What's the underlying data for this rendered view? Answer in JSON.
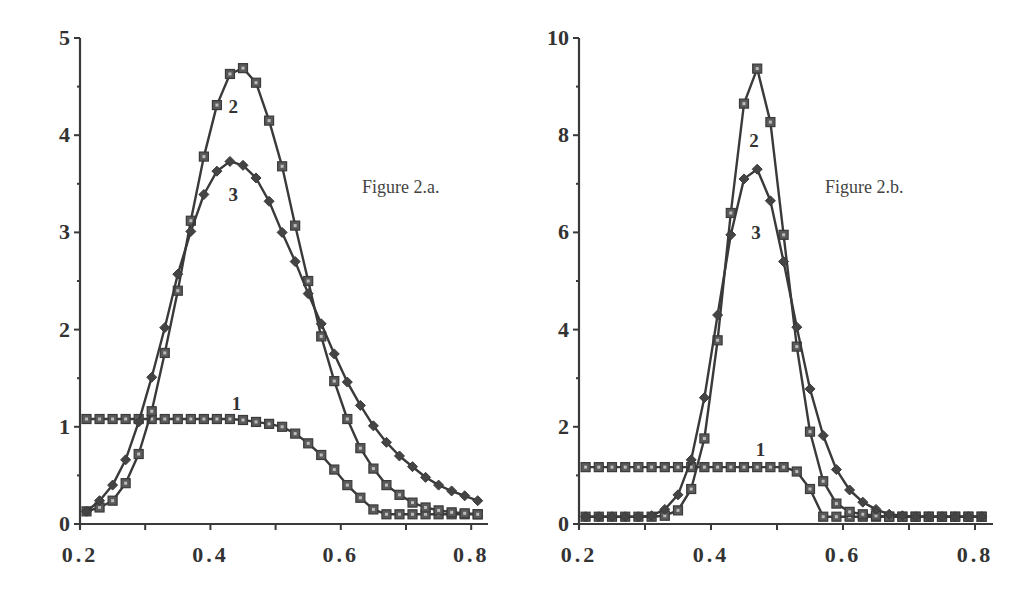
{
  "chart_data": [
    {
      "type": "line",
      "title": "Figure 2.a.",
      "xlabel": "",
      "ylabel": "",
      "xlim": [
        0.2,
        0.82
      ],
      "ylim": [
        0,
        5
      ],
      "xticks": [
        "0.2",
        "0.4",
        "0.6",
        "0.8"
      ],
      "yticks": [
        "0",
        "1",
        "2",
        "3",
        "4",
        "5"
      ],
      "grid": false,
      "legend": "inline curve labels 1, 2, 3",
      "series": [
        {
          "name": "1",
          "marker": "square",
          "label_pos": [
            0.44,
            1.25
          ],
          "x": [
            0.21,
            0.23,
            0.25,
            0.27,
            0.29,
            0.31,
            0.33,
            0.35,
            0.37,
            0.39,
            0.41,
            0.43,
            0.45,
            0.47,
            0.49,
            0.51,
            0.53,
            0.55,
            0.57,
            0.59,
            0.61,
            0.63,
            0.65,
            0.67,
            0.69,
            0.71,
            0.73,
            0.75,
            0.77,
            0.79,
            0.81
          ],
          "y": [
            1.08,
            1.08,
            1.08,
            1.08,
            1.08,
            1.08,
            1.08,
            1.08,
            1.08,
            1.08,
            1.08,
            1.08,
            1.07,
            1.05,
            1.03,
            1.0,
            0.93,
            0.83,
            0.71,
            0.56,
            0.4,
            0.27,
            0.15,
            0.1,
            0.1,
            0.1,
            0.1,
            0.1,
            0.1,
            0.1,
            0.1
          ]
        },
        {
          "name": "2",
          "marker": "square",
          "label_pos": [
            0.435,
            4.3
          ],
          "x": [
            0.21,
            0.23,
            0.25,
            0.27,
            0.29,
            0.31,
            0.33,
            0.35,
            0.37,
            0.39,
            0.41,
            0.43,
            0.45,
            0.47,
            0.49,
            0.51,
            0.53,
            0.55,
            0.57,
            0.59,
            0.61,
            0.63,
            0.65,
            0.67,
            0.69,
            0.71,
            0.73,
            0.75,
            0.77,
            0.79,
            0.81
          ],
          "y": [
            0.13,
            0.17,
            0.24,
            0.42,
            0.72,
            1.16,
            1.76,
            2.4,
            3.12,
            3.78,
            4.31,
            4.63,
            4.69,
            4.54,
            4.15,
            3.68,
            3.07,
            2.5,
            1.93,
            1.47,
            1.08,
            0.78,
            0.57,
            0.4,
            0.3,
            0.22,
            0.17,
            0.14,
            0.12,
            0.11,
            0.1
          ]
        },
        {
          "name": "3",
          "marker": "diamond",
          "label_pos": [
            0.435,
            3.4
          ],
          "x": [
            0.21,
            0.23,
            0.25,
            0.27,
            0.29,
            0.31,
            0.33,
            0.35,
            0.37,
            0.39,
            0.41,
            0.43,
            0.45,
            0.47,
            0.49,
            0.51,
            0.53,
            0.55,
            0.57,
            0.59,
            0.61,
            0.63,
            0.65,
            0.67,
            0.69,
            0.71,
            0.73,
            0.75,
            0.77,
            0.79,
            0.81
          ],
          "y": [
            0.13,
            0.24,
            0.4,
            0.66,
            1.05,
            1.51,
            2.02,
            2.57,
            3.01,
            3.39,
            3.63,
            3.73,
            3.69,
            3.56,
            3.32,
            3.0,
            2.7,
            2.37,
            2.06,
            1.75,
            1.46,
            1.22,
            1.01,
            0.84,
            0.7,
            0.59,
            0.48,
            0.4,
            0.34,
            0.29,
            0.24
          ]
        }
      ]
    },
    {
      "type": "line",
      "title": "Figure 2.b.",
      "xlabel": "",
      "ylabel": "",
      "xlim": [
        0.2,
        0.82
      ],
      "ylim": [
        0,
        10
      ],
      "xticks": [
        "0.2",
        "0.4",
        "0.6",
        "0.8"
      ],
      "yticks": [
        "0",
        "2",
        "4",
        "6",
        "8",
        "10"
      ],
      "grid": false,
      "legend": "inline curve labels 1, 2, 3",
      "series": [
        {
          "name": "1",
          "marker": "square",
          "label_pos": [
            0.475,
            1.55
          ],
          "x": [
            0.21,
            0.23,
            0.25,
            0.27,
            0.29,
            0.31,
            0.33,
            0.35,
            0.37,
            0.39,
            0.41,
            0.43,
            0.45,
            0.47,
            0.49,
            0.51,
            0.53,
            0.55,
            0.57,
            0.59,
            0.61,
            0.63,
            0.65,
            0.67,
            0.69,
            0.71,
            0.73,
            0.75,
            0.77,
            0.79,
            0.81
          ],
          "y": [
            1.17,
            1.17,
            1.17,
            1.17,
            1.17,
            1.17,
            1.17,
            1.17,
            1.17,
            1.17,
            1.17,
            1.17,
            1.17,
            1.17,
            1.17,
            1.17,
            1.08,
            0.72,
            0.15,
            0.15,
            0.15,
            0.15,
            0.15,
            0.15,
            0.15,
            0.15,
            0.15,
            0.15,
            0.15,
            0.15,
            0.15
          ]
        },
        {
          "name": "2",
          "marker": "square",
          "label_pos": [
            0.465,
            7.9
          ],
          "x": [
            0.21,
            0.23,
            0.25,
            0.27,
            0.29,
            0.31,
            0.33,
            0.35,
            0.37,
            0.39,
            0.41,
            0.43,
            0.45,
            0.47,
            0.49,
            0.51,
            0.53,
            0.55,
            0.57,
            0.59,
            0.61,
            0.63,
            0.65,
            0.67,
            0.69,
            0.71,
            0.73,
            0.75,
            0.77,
            0.79,
            0.81
          ],
          "y": [
            0.15,
            0.15,
            0.15,
            0.15,
            0.15,
            0.15,
            0.17,
            0.28,
            0.72,
            1.76,
            3.78,
            6.4,
            8.65,
            9.37,
            8.27,
            5.95,
            3.65,
            1.9,
            0.88,
            0.42,
            0.25,
            0.2,
            0.17,
            0.15,
            0.15,
            0.15,
            0.15,
            0.15,
            0.15,
            0.15,
            0.15
          ]
        },
        {
          "name": "3",
          "marker": "diamond",
          "label_pos": [
            0.468,
            6.0
          ],
          "x": [
            0.21,
            0.23,
            0.25,
            0.27,
            0.29,
            0.31,
            0.33,
            0.35,
            0.37,
            0.39,
            0.41,
            0.43,
            0.45,
            0.47,
            0.49,
            0.51,
            0.53,
            0.55,
            0.57,
            0.59,
            0.61,
            0.63,
            0.65,
            0.67,
            0.69,
            0.71,
            0.73,
            0.75,
            0.77,
            0.79,
            0.81
          ],
          "y": [
            0.15,
            0.15,
            0.15,
            0.15,
            0.15,
            0.17,
            0.3,
            0.6,
            1.32,
            2.6,
            4.3,
            5.95,
            7.1,
            7.3,
            6.65,
            5.4,
            4.05,
            2.78,
            1.82,
            1.12,
            0.7,
            0.45,
            0.3,
            0.2,
            0.17,
            0.15,
            0.15,
            0.15,
            0.15,
            0.15,
            0.15
          ]
        }
      ]
    }
  ],
  "panels": [
    {
      "title": "Figure 2.a."
    },
    {
      "title": "Figure 2.b."
    }
  ]
}
